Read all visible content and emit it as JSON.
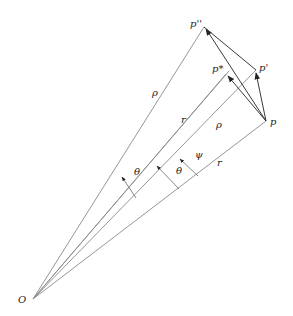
{
  "diagram": {
    "points": {
      "O": {
        "label": "O",
        "x": 33,
        "y": 299
      },
      "p": {
        "label": "p",
        "x": 266,
        "y": 121
      },
      "p_prime": {
        "label": "p'",
        "x": 256,
        "y": 70
      },
      "p_star": {
        "label": "p*",
        "x": 226,
        "y": 74
      },
      "p_double_prime": {
        "label": "p''",
        "x": 204,
        "y": 27
      }
    },
    "labels": {
      "rho_outer": "ρ",
      "r_mid": "r",
      "rho_inner": "ρ",
      "r_bottom": "r",
      "theta_left": "θ",
      "theta_right": "θ",
      "psi": "ψ"
    },
    "colors": {
      "line": "#8a8a8a",
      "vector": "#3a3a3a",
      "text": "#222222"
    }
  }
}
